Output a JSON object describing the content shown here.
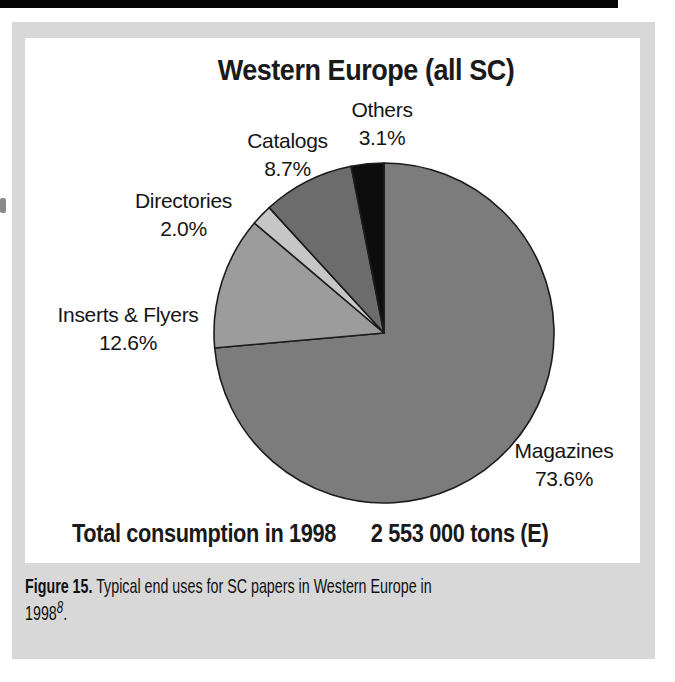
{
  "chart_data": {
    "type": "pie",
    "title": "Western Europe (all SC)",
    "direction": "clockwise",
    "start_angle_deg_from_top": 0,
    "slices": [
      {
        "label": "Magazines",
        "pct_label": "73.6%",
        "value": 73.6,
        "color": "#7c7c7c"
      },
      {
        "label": "Inserts & Flyers",
        "pct_label": "12.6%",
        "value": 12.6,
        "color": "#9c9c9c"
      },
      {
        "label": "Directories",
        "pct_label": "2.0%",
        "value": 2.0,
        "color": "#c6c6c6"
      },
      {
        "label": "Catalogs",
        "pct_label": "8.7%",
        "value": 8.7,
        "color": "#6c6c6c"
      },
      {
        "label": "Others",
        "pct_label": "3.1%",
        "value": 3.1,
        "color": "#0d0d0d"
      }
    ],
    "outline_color": "#1c1c1c",
    "footer": {
      "left": "Total consumption in 1998",
      "right": "2 553 000 tons (E)"
    }
  },
  "caption": {
    "prefix": "Figure 15.",
    "line1_rest": " Typical end uses for SC papers in Western Europe in",
    "year": "1998",
    "ref": "8",
    "period": "."
  }
}
